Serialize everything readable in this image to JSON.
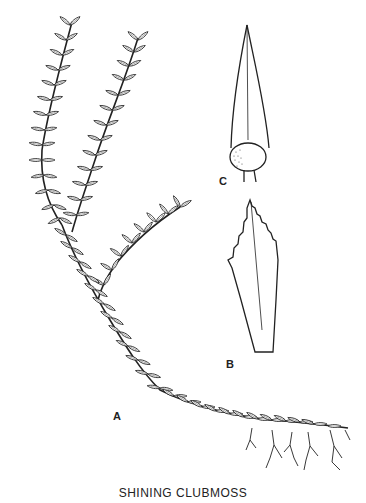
{
  "figure": {
    "caption": "SHINING  CLUBMOSS",
    "labels": {
      "a": "A",
      "b": "B",
      "c": "C"
    },
    "parts": {
      "a": "whole-plant-branching-stem",
      "b": "leaf-serrated",
      "c": "leaf-with-sporangium"
    },
    "colors": {
      "ink": "#222222",
      "background": "#ffffff"
    }
  }
}
